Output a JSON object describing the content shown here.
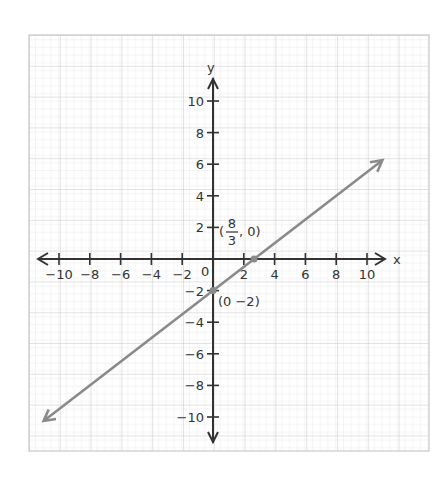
{
  "chart_data": {
    "type": "line",
    "title": "",
    "xlabel": "x",
    "ylabel": "y",
    "xlim": [
      -10,
      10
    ],
    "ylim": [
      -10,
      10
    ],
    "grid": true,
    "x_ticks": [
      -10,
      -8,
      -6,
      -4,
      -2,
      2,
      4,
      6,
      8,
      10
    ],
    "y_ticks": [
      10,
      8,
      6,
      4,
      2,
      -2,
      -4,
      -6,
      -8,
      -10
    ],
    "origin_label": "0",
    "series": [
      {
        "name": "line",
        "equation": "y = (3/4)x - 2",
        "slope": 0.75,
        "intercept": -2,
        "x": [
          -11,
          11
        ],
        "y": [
          -10.25,
          6.25
        ],
        "color": "#8a8a8a"
      }
    ],
    "points": [
      {
        "x": 2.667,
        "y": 0,
        "label": "(8/3, 0)",
        "label_num": "8",
        "label_den": "3",
        "label_rest": ", 0)"
      },
      {
        "x": 0,
        "y": -2,
        "label": "(0 -2)"
      }
    ],
    "annotations": [
      "(8/3, 0)",
      "(0 -2)"
    ],
    "colors": {
      "axis": "#333333",
      "line": "#8a8a8a",
      "grid_major": "#c8c8c8",
      "grid_minor": "#e6e6e6"
    }
  }
}
